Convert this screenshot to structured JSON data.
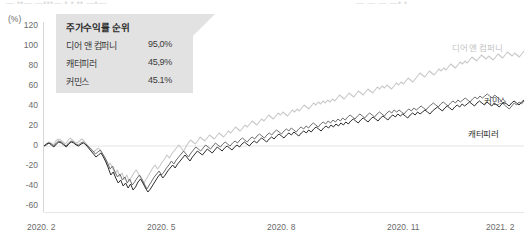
{
  "header": {
    "fragments": [
      "— ▪▪—   —▪▪▪—  ▪ ▪   ▪▪ —▪—",
      "—    —    —   —▪ ▪"
    ]
  },
  "chart_data": {
    "type": "line",
    "title": "",
    "unit_label": "(%)",
    "xlabel": "",
    "ylabel": "",
    "ylim": [
      -60,
      120
    ],
    "yticks": [
      120,
      100,
      80,
      60,
      40,
      20,
      0,
      -20,
      -40,
      -60
    ],
    "ytick_labels": [
      "120",
      "100",
      "80",
      "60",
      "40",
      "20",
      "0",
      "-20",
      "-40",
      "-60"
    ],
    "xticks": [
      "2020. 2",
      "2020. 5",
      "2020. 8",
      "2020. 11",
      "2021. 2"
    ],
    "grid": false,
    "zero_line": true,
    "legend_position": "right-inline",
    "series": [
      {
        "name": "디어 앤 컴퍼니",
        "color": "#c8c8c8",
        "final_value": 95.0,
        "values": [
          0,
          2,
          4,
          3,
          1,
          5,
          7,
          6,
          4,
          2,
          5,
          8,
          6,
          4,
          3,
          5,
          7,
          5,
          2,
          -1,
          -3,
          -6,
          -4,
          -2,
          -5,
          -9,
          -14,
          -20,
          -17,
          -22,
          -28,
          -24,
          -30,
          -27,
          -33,
          -29,
          -35,
          -31,
          -27,
          -24,
          -28,
          -33,
          -38,
          -34,
          -30,
          -26,
          -22,
          -19,
          -23,
          -20,
          -16,
          -13,
          -9,
          -12,
          -8,
          -5,
          -2,
          1,
          -2,
          -5,
          -1,
          3,
          6,
          4,
          2,
          5,
          9,
          7,
          5,
          8,
          11,
          9,
          7,
          10,
          13,
          11,
          9,
          12,
          15,
          13,
          16,
          19,
          17,
          15,
          18,
          21,
          19,
          22,
          25,
          23,
          21,
          24,
          27,
          25,
          28,
          31,
          29,
          27,
          30,
          33,
          31,
          34,
          32,
          30,
          33,
          36,
          34,
          37,
          35,
          38,
          41,
          39,
          37,
          40,
          43,
          41,
          44,
          42,
          45,
          43,
          46,
          44,
          47,
          45,
          48,
          51,
          49,
          47,
          50,
          53,
          51,
          49,
          52,
          55,
          53,
          51,
          54,
          57,
          55,
          53,
          56,
          59,
          57,
          60,
          58,
          61,
          59,
          57,
          60,
          63,
          61,
          64,
          62,
          65,
          68,
          66,
          64,
          67,
          70,
          73,
          71,
          69,
          72,
          75,
          73,
          71,
          74,
          77,
          75,
          78,
          76,
          79,
          82,
          80,
          78,
          81,
          84,
          82,
          85,
          83,
          86,
          89,
          87,
          85,
          88,
          91,
          89,
          87,
          90,
          88,
          86,
          89,
          92,
          90,
          88,
          91,
          94,
          92,
          90,
          93,
          91,
          89,
          92,
          95
        ]
      },
      {
        "name": "커민스",
        "color": "#6f6f6f",
        "final_value": 45.1,
        "values": [
          0,
          1,
          3,
          2,
          0,
          3,
          5,
          4,
          2,
          0,
          3,
          5,
          4,
          2,
          1,
          3,
          4,
          2,
          0,
          -3,
          -5,
          -8,
          -6,
          -4,
          -8,
          -12,
          -17,
          -23,
          -20,
          -26,
          -31,
          -28,
          -34,
          -31,
          -37,
          -33,
          -39,
          -36,
          -32,
          -29,
          -33,
          -38,
          -43,
          -39,
          -35,
          -31,
          -28,
          -25,
          -29,
          -26,
          -22,
          -19,
          -15,
          -18,
          -14,
          -11,
          -8,
          -5,
          -8,
          -11,
          -7,
          -4,
          -1,
          -3,
          -5,
          -2,
          1,
          -1,
          -3,
          0,
          3,
          1,
          -1,
          2,
          4,
          2,
          0,
          3,
          5,
          3,
          6,
          8,
          6,
          4,
          7,
          9,
          7,
          10,
          12,
          10,
          8,
          11,
          13,
          11,
          14,
          16,
          14,
          12,
          15,
          17,
          15,
          18,
          16,
          14,
          17,
          19,
          17,
          20,
          18,
          21,
          23,
          21,
          19,
          22,
          24,
          22,
          25,
          23,
          26,
          24,
          27,
          25,
          28,
          26,
          29,
          31,
          29,
          27,
          30,
          32,
          30,
          28,
          31,
          33,
          31,
          29,
          32,
          34,
          32,
          30,
          33,
          35,
          33,
          36,
          34,
          36,
          34,
          32,
          35,
          37,
          35,
          38,
          36,
          38,
          40,
          38,
          36,
          39,
          41,
          43,
          41,
          39,
          42,
          44,
          42,
          40,
          43,
          45,
          43,
          46,
          44,
          46,
          48,
          46,
          44,
          47,
          49,
          47,
          50,
          48,
          50,
          52,
          50,
          48,
          51,
          49,
          47,
          44,
          41,
          39,
          37,
          40,
          43,
          41,
          44,
          42,
          45
        ]
      },
      {
        "name": "캐터피러",
        "color": "#2f2f2f",
        "final_value": 45.9,
        "values": [
          0,
          2,
          3,
          1,
          -1,
          2,
          4,
          3,
          1,
          -1,
          2,
          4,
          3,
          1,
          0,
          2,
          3,
          1,
          -2,
          -5,
          -8,
          -11,
          -9,
          -7,
          -11,
          -16,
          -22,
          -29,
          -26,
          -32,
          -37,
          -34,
          -40,
          -37,
          -42,
          -38,
          -44,
          -41,
          -36,
          -33,
          -37,
          -42,
          -46,
          -43,
          -39,
          -35,
          -31,
          -28,
          -32,
          -29,
          -25,
          -22,
          -19,
          -22,
          -18,
          -15,
          -12,
          -9,
          -12,
          -15,
          -11,
          -8,
          -5,
          -7,
          -9,
          -6,
          -3,
          -5,
          -7,
          -4,
          -1,
          -3,
          -5,
          -2,
          0,
          -2,
          -4,
          -1,
          1,
          -1,
          2,
          4,
          2,
          0,
          3,
          5,
          3,
          6,
          8,
          6,
          4,
          7,
          9,
          7,
          10,
          12,
          10,
          8,
          11,
          13,
          11,
          14,
          12,
          10,
          13,
          15,
          13,
          16,
          14,
          17,
          19,
          17,
          15,
          18,
          20,
          18,
          21,
          19,
          22,
          20,
          23,
          21,
          24,
          22,
          25,
          27,
          25,
          23,
          26,
          28,
          26,
          24,
          27,
          29,
          27,
          25,
          28,
          30,
          28,
          26,
          29,
          31,
          29,
          32,
          30,
          32,
          30,
          28,
          31,
          33,
          31,
          34,
          32,
          34,
          36,
          34,
          32,
          35,
          37,
          39,
          37,
          35,
          38,
          40,
          38,
          36,
          39,
          41,
          39,
          42,
          40,
          42,
          44,
          42,
          40,
          43,
          45,
          43,
          41,
          44,
          42,
          40,
          43,
          41,
          39,
          42,
          44,
          42,
          40,
          43,
          45,
          43,
          41,
          44,
          46
        ]
      }
    ]
  },
  "legend_panel": {
    "title": "주가수익률 순위",
    "rows": [
      {
        "name": "디어 앤 컴퍼니",
        "value": "95,0%"
      },
      {
        "name": "캐터피러",
        "value": "45,9%"
      },
      {
        "name": "커민스",
        "value": "45.1%"
      }
    ]
  },
  "series_labels": [
    {
      "name": "디어 앤 컴퍼니"
    },
    {
      "name": "커민스"
    },
    {
      "name": "캐터피러"
    }
  ]
}
